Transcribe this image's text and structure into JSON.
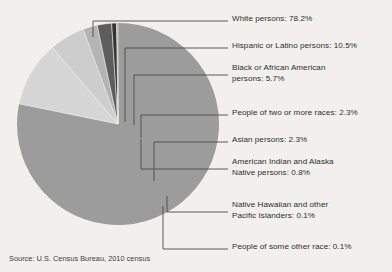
{
  "background_color": "#f1f0ed",
  "text_color": "#2e2e2e",
  "leader_line_color": "#4a4a4a",
  "source": {
    "text": "Source: U.S. Census Bureau, 2010 census"
  },
  "labels": [
    {
      "id": "white",
      "text": "White persons: 78.2%",
      "x": 232,
      "y": 14
    },
    {
      "id": "hispanic",
      "text": "Hispanic or Latino persons: 10.5%",
      "x": 232,
      "y": 41
    },
    {
      "id": "black",
      "text": "Black or African American\npersons: 5.7%",
      "x": 232,
      "y": 68
    },
    {
      "id": "twoplus",
      "text": "People of two or more races: 2.3%",
      "x": 232,
      "y": 108
    },
    {
      "id": "asian",
      "text": "Asian persons: 2.3%",
      "x": 232,
      "y": 135
    },
    {
      "id": "aian",
      "text": "American Indian and Alaska\nNative persons: 0.8%",
      "x": 232,
      "y": 162
    },
    {
      "id": "nhpi",
      "text": "Native Hawaiian and other\nPacific Islanders: 0.1%",
      "x": 232,
      "y": 202
    },
    {
      "id": "other",
      "text": "People of some other race: 0.1%",
      "x": 232,
      "y": 242
    }
  ],
  "chart_data": {
    "type": "pie",
    "title": "",
    "source": "Source: U.S. Census Bureau, 2010 census",
    "start_angle_deg": 0,
    "direction": "clockwise",
    "center": {
      "x": 118,
      "y": 124
    },
    "radius": 101,
    "legend_position": "callout-labels-right",
    "total_percent": 100.0,
    "categories": [
      "White persons",
      "Hispanic or Latino persons",
      "Black or African American persons",
      "People of two or more races",
      "Asian persons",
      "American Indian and Alaska Native persons",
      "Native Hawaiian and other Pacific Islanders",
      "People of some other race"
    ],
    "values": [
      78.2,
      10.5,
      5.7,
      2.3,
      2.3,
      0.8,
      0.1,
      0.1
    ],
    "value_labels": [
      "78.2%",
      "10.5%",
      "5.7%",
      "2.3%",
      "2.3%",
      "0.8%",
      "0.1%",
      "0.1%"
    ],
    "colors": [
      "#9c9c9c",
      "#d6d6d6",
      "#cdcdcd",
      "#b4b4b4",
      "#5d5d5d",
      "#343434",
      "#fdfdfd",
      "#1f1f1f"
    ],
    "slices": [
      {
        "name": "White persons",
        "value": 78.2,
        "color": "#9c9c9c"
      },
      {
        "name": "Hispanic or Latino persons",
        "value": 10.5,
        "color": "#d6d6d6"
      },
      {
        "name": "Black or African American persons",
        "value": 5.7,
        "color": "#cdcdcd"
      },
      {
        "name": "People of two or more races",
        "value": 2.3,
        "color": "#b4b4b4"
      },
      {
        "name": "Asian persons",
        "value": 2.3,
        "color": "#5d5d5d"
      },
      {
        "name": "American Indian and Alaska Native persons",
        "value": 0.8,
        "color": "#343434"
      },
      {
        "name": "Native Hawaiian and other Pacific Islanders",
        "value": 0.1,
        "color": "#fdfdfd"
      },
      {
        "name": "People of some other race",
        "value": 0.1,
        "color": "#1f1f1f"
      }
    ]
  }
}
